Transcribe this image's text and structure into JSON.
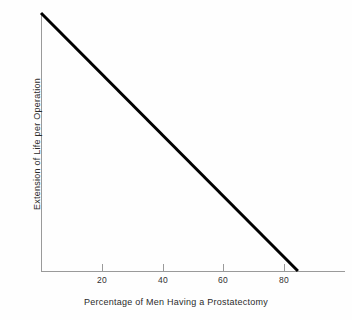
{
  "chart_data": {
    "type": "line",
    "title": "",
    "xlabel": "Percentage of Men Having a Prostatectomy",
    "ylabel": "Extension of Life per Operation",
    "xlim": [
      0,
      100
    ],
    "ylim": [
      0,
      100
    ],
    "xticks": [
      20,
      40,
      60,
      80
    ],
    "xtick_labels": [
      "20",
      "40",
      "60",
      "80"
    ],
    "yticks": [],
    "ytick_labels": [],
    "grid": false,
    "legend": null,
    "series": [
      {
        "name": "Extension of Life per Operation",
        "color": "#000000",
        "linewidth": 3,
        "x": [
          0,
          84.5
        ],
        "y": [
          100,
          0
        ],
        "points": [
          {
            "x": 0,
            "y": 100
          },
          {
            "x": 84.5,
            "y": 0
          }
        ]
      }
    ],
    "annotations": []
  },
  "axes": {
    "x_axis_label": "Percentage of Men Having a Prostatectomy",
    "y_axis_label": "Extension of Life per Operation",
    "axis_color": "#9a9a9a",
    "tick_labels": [
      "20",
      "40",
      "60",
      "80"
    ]
  },
  "style": {
    "background": "#fefefe",
    "line_color": "#000000",
    "text_color": "#2b2b2b"
  }
}
